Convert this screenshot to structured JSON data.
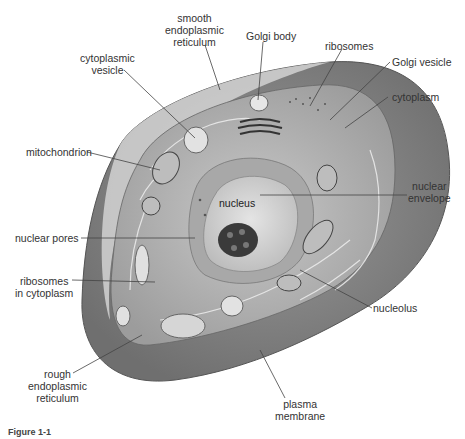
{
  "diagram": {
    "labels": {
      "smooth_er": [
        "smooth",
        "endoplasmic",
        "reticulum"
      ],
      "golgi_body": "Golgi body",
      "ribosomes": "ribosomes",
      "golgi_vesicle": "Golgi vesicle",
      "cytoplasm": "cytoplasm",
      "cytoplasmic_vesicle": [
        "cytoplasmic",
        "vesicle"
      ],
      "mitochondrion": "mitochondrion",
      "nucleus": "nucleus",
      "nuclear_envelope": [
        "nuclear",
        "envelope"
      ],
      "nuclear_pores": "nuclear pores",
      "ribosomes_in_cytoplasm": [
        "ribosomes",
        "in cytoplasm"
      ],
      "nucleolus": "nucleolus",
      "rough_er": [
        "rough",
        "endoplasmic",
        "reticulum"
      ],
      "plasma_membrane": [
        "plasma",
        "membrane"
      ]
    },
    "caption": "Figure 1-1"
  }
}
